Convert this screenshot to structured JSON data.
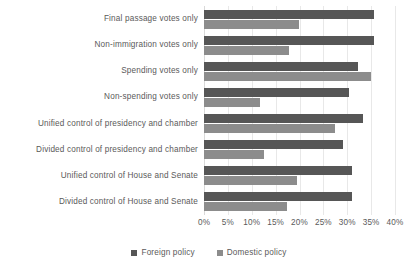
{
  "chart_data": {
    "type": "bar",
    "orientation": "horizontal",
    "title": "",
    "subtitle": "",
    "xlabel": "",
    "ylabel": "",
    "xlim": [
      0,
      40
    ],
    "xtick_labels": [
      "0%",
      "5%",
      "10%",
      "15%",
      "20%",
      "25%",
      "30%",
      "35%",
      "40%"
    ],
    "xtick_values": [
      0,
      5,
      10,
      15,
      20,
      25,
      30,
      35,
      40
    ],
    "grid": true,
    "legend_position": "bottom",
    "categories": [
      "Final passage votes only",
      "Non-immigration votes only",
      "Spending votes only",
      "Non-spending votes only",
      "Unified control of presidency and chamber",
      "Divided control of presidency and chamber",
      "Unified control of House and Senate",
      "Divided control of House and Senate"
    ],
    "series": [
      {
        "name": "Foreign policy",
        "color": "#565656",
        "values": [
          35.6,
          35.6,
          32.3,
          30.3,
          33.2,
          29.2,
          31.0,
          31.0
        ]
      },
      {
        "name": "Domestic policy",
        "color": "#8c8c8c",
        "values": [
          19.9,
          17.8,
          35.0,
          11.7,
          27.5,
          12.6,
          19.4,
          17.4
        ]
      }
    ]
  },
  "colors": {
    "foreign_policy": "#565656",
    "domestic_policy": "#8c8c8c",
    "gridline": "#e8e8e8",
    "text": "#5a5a5a",
    "background": "#ffffff"
  }
}
